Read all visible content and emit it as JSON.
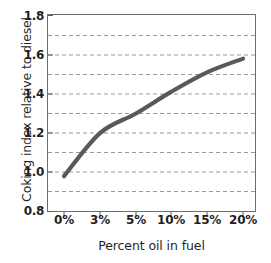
{
  "chart_data": {
    "type": "line",
    "title": "",
    "xlabel": "Percent oil in fuel",
    "ylabel": "Coking index relative to diesel",
    "categories": [
      "0%",
      "3%",
      "5%",
      "10%",
      "15%",
      "20%"
    ],
    "values": [
      0.98,
      1.2,
      1.3,
      1.41,
      1.51,
      1.58
    ],
    "series": [
      {
        "name": "Coking index",
        "values": [
          0.98,
          1.2,
          1.3,
          1.41,
          1.51,
          1.58
        ],
        "color": "#595959"
      }
    ],
    "ylim": [
      0.8,
      1.8
    ],
    "ytick_labels": [
      "0.8",
      "1.0",
      "1.2",
      "1.4",
      "1.6",
      "1.8"
    ],
    "ytick_values": [
      0.8,
      1.0,
      1.2,
      1.4,
      1.6,
      1.8
    ],
    "gridlines": [
      0.9,
      1.0,
      1.1,
      1.2,
      1.3,
      1.4,
      1.5,
      1.6,
      1.7
    ],
    "grid": true,
    "grid_style": "dashed",
    "grid_color": "#9a9a9a",
    "legend": "none",
    "axis_color": "#6e6e6e",
    "plot_background": "#ffffff"
  }
}
